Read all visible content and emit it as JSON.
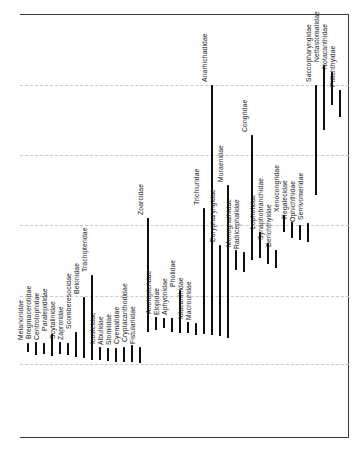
{
  "figure": {
    "width": 359,
    "height": 454,
    "background": "#ffffff",
    "bar_color": "#0d0d0d",
    "label_color": "#1b1b1b",
    "frame_color": "#3a3a3a",
    "gridline_color": "#c9c9c9",
    "frame": {
      "left_x": 20,
      "right_x": 348,
      "top_y": 14,
      "bottom_y": 437
    },
    "gridlines_y": [
      85,
      155,
      225,
      296,
      364
    ]
  },
  "chart_data": {
    "type": "bar",
    "subtype": "vertical-range-chart",
    "title": "",
    "xlabel": "",
    "ylabel": "",
    "axis_tick_labels": "none visible",
    "grid": "horizontal dashed lines at equal intervals between solid top and bottom frame lines; solid vertical line at right edge",
    "legend": "none",
    "note": "Each fish family is drawn as a vertical black range bar with its name rotated 90deg above the bar top. Pixel coordinates (y down) describe bar extents; no numeric axis labels are present in the image.",
    "families": [
      {
        "name": "Melanonidae",
        "x": 28,
        "bar_top": 343,
        "bar_bottom": 352
      },
      {
        "name": "Bregmacerotidae",
        "x": 36,
        "bar_top": 342,
        "bar_bottom": 355
      },
      {
        "name": "Centrolophidae",
        "x": 44,
        "bar_top": 343,
        "bar_bottom": 354
      },
      {
        "name": "Paralepididae",
        "x": 52,
        "bar_top": 334,
        "bar_bottom": 356
      },
      {
        "name": "Scytalinidae",
        "x": 60,
        "bar_top": 342,
        "bar_bottom": 354
      },
      {
        "name": "Zaproridae",
        "x": 68,
        "bar_top": 343,
        "bar_bottom": 355
      },
      {
        "name": "Scomberesocidae",
        "x": 76,
        "bar_top": 332,
        "bar_bottom": 357
      },
      {
        "name": "Belonidae",
        "x": 84,
        "bar_top": 297,
        "bar_bottom": 358
      },
      {
        "name": "Trachipteridae",
        "x": 92,
        "bar_top": 275,
        "bar_bottom": 360
      },
      {
        "name": "Icosteidae",
        "x": 100,
        "bar_top": 347,
        "bar_bottom": 360
      },
      {
        "name": "Albulidae",
        "x": 108,
        "bar_top": 348,
        "bar_bottom": 361
      },
      {
        "name": "Stomiidae",
        "x": 116,
        "bar_top": 348,
        "bar_bottom": 362
      },
      {
        "name": "Cyematidae",
        "x": 124,
        "bar_top": 347,
        "bar_bottom": 362
      },
      {
        "name": "Cryptacanthodidae",
        "x": 132,
        "bar_top": 345,
        "bar_bottom": 362
      },
      {
        "name": "Fistulariidae",
        "x": 140,
        "bar_top": 347,
        "bar_bottom": 363
      },
      {
        "name": "Zoarcidae",
        "x": 148,
        "bar_top": 218,
        "bar_bottom": 332
      },
      {
        "name": "Anotopteridae",
        "x": 156,
        "bar_top": 317,
        "bar_bottom": 330
      },
      {
        "name": "Elopidae",
        "x": 164,
        "bar_top": 318,
        "bar_bottom": 328
      },
      {
        "name": "Aphyonidae",
        "x": 172,
        "bar_top": 318,
        "bar_bottom": 332
      },
      {
        "name": "Pholidae",
        "x": 180,
        "bar_top": 290,
        "bar_bottom": 333
      },
      {
        "name": "Idiacanthidae",
        "x": 188,
        "bar_top": 322,
        "bar_bottom": 333
      },
      {
        "name": "Macrouridae",
        "x": 196,
        "bar_top": 323,
        "bar_bottom": 335
      },
      {
        "name": "Trichiuridae",
        "x": 204,
        "bar_top": 208,
        "bar_bottom": 334
      },
      {
        "name": "Anarhichadidae",
        "x": 212,
        "bar_top": 85,
        "bar_bottom": 335
      },
      {
        "name": "Eurypharyngidae",
        "x": 220,
        "bar_top": 245,
        "bar_bottom": 336
      },
      {
        "name": "Muraenidae",
        "x": 228,
        "bar_top": 185,
        "bar_bottom": 338
      },
      {
        "name": "Monognathidae",
        "x": 236,
        "bar_top": 250,
        "bar_bottom": 270
      },
      {
        "name": "Radiicephalidae",
        "x": 244,
        "bar_top": 252,
        "bar_bottom": 272
      },
      {
        "name": "Congridae",
        "x": 252,
        "bar_top": 135,
        "bar_bottom": 260
      },
      {
        "name": "Lophotidae",
        "x": 260,
        "bar_top": 232,
        "bar_bottom": 258
      },
      {
        "name": "Synaphobranchidae",
        "x": 268,
        "bar_top": 243,
        "bar_bottom": 264
      },
      {
        "name": "Derichthyidae",
        "x": 276,
        "bar_top": 250,
        "bar_bottom": 268
      },
      {
        "name": "Xenocongridae",
        "x": 284,
        "bar_top": 215,
        "bar_bottom": 232
      },
      {
        "name": "Regalecidae",
        "x": 292,
        "bar_top": 222,
        "bar_bottom": 238
      },
      {
        "name": "Ophichthidae",
        "x": 300,
        "bar_top": 225,
        "bar_bottom": 240
      },
      {
        "name": "Serrivomeridae",
        "x": 308,
        "bar_top": 223,
        "bar_bottom": 242
      },
      {
        "name": "Saccopharyngidae",
        "x": 316,
        "bar_top": 85,
        "bar_bottom": 195
      },
      {
        "name": "Nettastomatidae",
        "x": 324,
        "bar_top": 65,
        "bar_bottom": 130
      },
      {
        "name": "Notacanthidae",
        "x": 332,
        "bar_top": 72,
        "bar_bottom": 105
      },
      {
        "name": "Ptilichthyidae",
        "x": 340,
        "bar_top": 90,
        "bar_bottom": 117
      }
    ]
  }
}
